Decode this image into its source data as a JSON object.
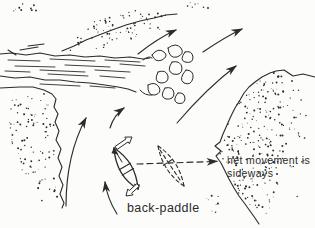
{
  "diagram": {
    "labels": {
      "net_movement_line1": "net movement is",
      "net_movement_line2": "sideways",
      "technique_caption": "back-paddle"
    },
    "colors": {
      "ink": "#2b2b2b",
      "paper": "#fcfcfa"
    },
    "elements": [
      "fallen-tree-log",
      "top-bank-stipple",
      "left-bank-stipple",
      "right-bank-stipple",
      "current-flow-arrows",
      "canoe",
      "canoe-bow-stroke-arrow",
      "canoe-stern-stroke-arrow",
      "ghost-canoe-position",
      "net-movement-dashed-arrow"
    ]
  }
}
